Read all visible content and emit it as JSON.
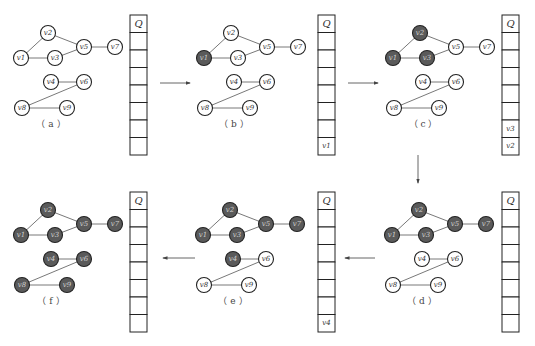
{
  "colors": {
    "visited": "#5a5a5a",
    "unvisited": "#ffffff",
    "visited_text": "#cfcfcf",
    "unvisited_text": "#333333"
  },
  "graph": {
    "nodes": [
      {
        "id": "v1",
        "label": "v1",
        "x": 17,
        "y": 38
      },
      {
        "id": "v2",
        "label": "v2",
        "x": 44,
        "y": 13
      },
      {
        "id": "v3",
        "label": "v3",
        "x": 51,
        "y": 38
      },
      {
        "id": "v5",
        "label": "v5",
        "x": 80,
        "y": 27
      },
      {
        "id": "v7",
        "label": "v7",
        "x": 111,
        "y": 27
      },
      {
        "id": "v4",
        "label": "v4",
        "x": 47,
        "y": 62
      },
      {
        "id": "v6",
        "label": "v6",
        "x": 80,
        "y": 62
      },
      {
        "id": "v8",
        "label": "v8",
        "x": 18,
        "y": 88
      },
      {
        "id": "v9",
        "label": "v9",
        "x": 63,
        "y": 88
      }
    ],
    "edges": [
      [
        "v1",
        "v2"
      ],
      [
        "v1",
        "v3"
      ],
      [
        "v2",
        "v5"
      ],
      [
        "v3",
        "v5"
      ],
      [
        "v5",
        "v7"
      ],
      [
        "v4",
        "v6"
      ],
      [
        "v6",
        "v8"
      ],
      [
        "v8",
        "v9"
      ]
    ]
  },
  "queue": {
    "header": "Q",
    "slots": 7
  },
  "panels": [
    {
      "id": "a",
      "label": "（ a ）",
      "ox": 4,
      "oy": 20,
      "qx": 130,
      "qy": 15,
      "visited": [],
      "queue": []
    },
    {
      "id": "b",
      "label": "（ b ）",
      "ox": 187,
      "oy": 20,
      "qx": 318,
      "qy": 15,
      "visited": [
        "v1"
      ],
      "queue": [
        "v1"
      ]
    },
    {
      "id": "c",
      "label": "（ c ）",
      "ox": 376,
      "oy": 20,
      "qx": 502,
      "qy": 15,
      "visited": [
        "v1",
        "v2",
        "v3"
      ],
      "queue": [
        "v3",
        "v2"
      ]
    },
    {
      "id": "d",
      "label": "（ d ）",
      "ox": 375,
      "oy": 197,
      "qx": 502,
      "qy": 192,
      "visited": [
        "v1",
        "v2",
        "v3",
        "v5",
        "v7"
      ],
      "queue": []
    },
    {
      "id": "e",
      "label": "（ e ）",
      "ox": 186,
      "oy": 197,
      "qx": 318,
      "qy": 192,
      "visited": [
        "v1",
        "v2",
        "v3",
        "v5",
        "v7",
        "v4"
      ],
      "queue": [
        "v4"
      ]
    },
    {
      "id": "f",
      "label": "（ f ）",
      "ox": 4,
      "oy": 197,
      "qx": 130,
      "qy": 192,
      "visited": [
        "v1",
        "v2",
        "v3",
        "v5",
        "v7",
        "v4",
        "v6",
        "v8",
        "v9"
      ],
      "queue": []
    }
  ],
  "arrows": [
    {
      "from": "a",
      "to": "b",
      "x1": 160,
      "y1": 83,
      "x2": 190,
      "y2": 83,
      "dir": "right"
    },
    {
      "from": "b",
      "to": "c",
      "x1": 348,
      "y1": 83,
      "x2": 378,
      "y2": 83,
      "dir": "right"
    },
    {
      "from": "c",
      "to": "d",
      "x1": 418,
      "y1": 155,
      "x2": 418,
      "y2": 183,
      "dir": "down"
    },
    {
      "from": "d",
      "to": "e",
      "x1": 375,
      "y1": 258,
      "x2": 345,
      "y2": 258,
      "dir": "left"
    },
    {
      "from": "e",
      "to": "f",
      "x1": 195,
      "y1": 258,
      "x2": 163,
      "y2": 258,
      "dir": "left"
    }
  ]
}
